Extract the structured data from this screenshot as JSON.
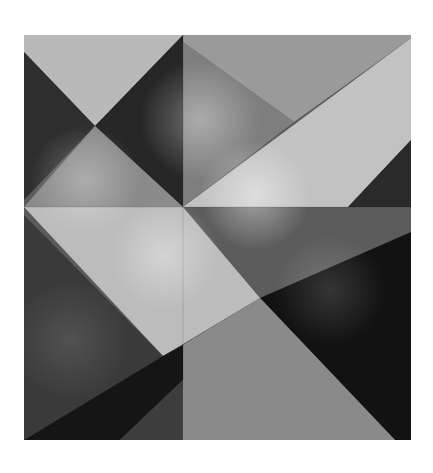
{
  "artwork": {
    "title": "Abstract grayscale geometric composition",
    "frame": {
      "x": 24,
      "y": 35,
      "width": 387,
      "height": 405
    },
    "background": "#ffffff",
    "palette": {
      "darkest": "#0c0c0c",
      "dark": "#2a2a2a",
      "mid_dark": "#4a4a4a",
      "mid": "#7a7a7a",
      "mid_light": "#9d9d9d",
      "light": "#bdbdbd",
      "lightest": "#d6d6d6"
    },
    "polygons": [
      {
        "name": "base-fill",
        "points": "24,35 411,35 411,440 24,440",
        "fill": "#5a5a5a"
      },
      {
        "name": "top-left-light-triangle",
        "points": "24,35 183,35 95,126 24,52",
        "fill": "#b9b9b9"
      },
      {
        "name": "left-dark-wedge",
        "points": "24,52 95,126 24,200",
        "fill": "#2e2e2e"
      },
      {
        "name": "upper-center-dark-wedge",
        "points": "183,35 183,207 95,126",
        "fill": "#262626"
      },
      {
        "name": "left-mid-gray-triangle",
        "points": "24,207 95,126 183,207",
        "fill": "#8a8a8a"
      },
      {
        "name": "top-right-gray-panel",
        "points": "183,35 411,35 411,38 294,122 183,42",
        "fill": "#9a9a9a"
      },
      {
        "name": "top-center-shadow-panel",
        "points": "183,42 294,122 183,207",
        "fill": "#7e7e7e"
      },
      {
        "name": "light-diagonal-band",
        "points": "183,207 411,38 411,140 348,207",
        "fill": "#c2c2c2"
      },
      {
        "name": "right-dark-corner",
        "points": "411,140 411,207 348,207",
        "fill": "#2a2a2a"
      },
      {
        "name": "middle-gray-band",
        "points": "183,207 411,207 411,232 260,298",
        "fill": "#5c5c5c"
      },
      {
        "name": "right-black-area",
        "points": "411,232 411,440 395,440 260,298",
        "fill": "#121212"
      },
      {
        "name": "center-light-parallelogram",
        "points": "24,207 183,207 260,298 163,356",
        "fill": "#bcbcbc"
      },
      {
        "name": "left-bottom-dark",
        "points": "24,215 163,356 24,440",
        "fill": "#3a3a3a"
      },
      {
        "name": "bottom-right-mid-band",
        "points": "260,298 395,440 183,440 183,345",
        "fill": "#8a8a8a"
      },
      {
        "name": "bottom-center-black-wedge",
        "points": "163,356 183,345 183,380 120,440 24,440",
        "fill": "#151515"
      },
      {
        "name": "bottom-center-gray",
        "points": "183,380 183,440 120,440",
        "fill": "#3d3d3d"
      }
    ],
    "glows": [
      {
        "name": "glow-upper-center",
        "cx": 200,
        "cy": 120,
        "r": 60,
        "opacity": 0.35
      },
      {
        "name": "glow-left-mid",
        "cx": 85,
        "cy": 180,
        "r": 55,
        "opacity": 0.3
      },
      {
        "name": "glow-center-right",
        "cx": 255,
        "cy": 195,
        "r": 55,
        "opacity": 0.45
      },
      {
        "name": "glow-center",
        "cx": 165,
        "cy": 255,
        "r": 55,
        "opacity": 0.35
      },
      {
        "name": "glow-lower-right",
        "cx": 330,
        "cy": 290,
        "r": 55,
        "opacity": 0.15
      },
      {
        "name": "glow-lower-left",
        "cx": 70,
        "cy": 340,
        "r": 60,
        "opacity": 0.12
      }
    ],
    "lines": [
      {
        "name": "vertical-seam",
        "x1": 183,
        "y1": 35,
        "x2": 183,
        "y2": 380
      },
      {
        "name": "horizontal-seam",
        "x1": 24,
        "y1": 207,
        "x2": 411,
        "y2": 207
      }
    ]
  }
}
